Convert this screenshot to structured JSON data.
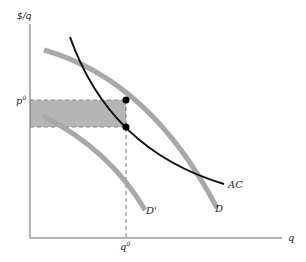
{
  "diagram": {
    "type": "economics-cost-demand",
    "axes": {
      "y_label": "$/q",
      "x_label": "q"
    },
    "markers": {
      "price": "p",
      "price_superscript": "0",
      "quantity": "q",
      "quantity_superscript": "0"
    },
    "curves": [
      {
        "id": "AC",
        "label": "AC",
        "color": "#111111",
        "style": "solid-black"
      },
      {
        "id": "D",
        "label": "D",
        "color": "#a8a8a8",
        "style": "thick-gray"
      },
      {
        "id": "D_prime",
        "label": "D'",
        "color": "#a8a8a8",
        "style": "thick-gray"
      }
    ],
    "shaded_region": {
      "description": "rectangle between p0 and AC at q0",
      "color": "#b5b5b5"
    },
    "points": [
      {
        "name": "demand-at-q0",
        "on": "D"
      },
      {
        "name": "ac-at-q0",
        "on": "AC"
      }
    ]
  }
}
